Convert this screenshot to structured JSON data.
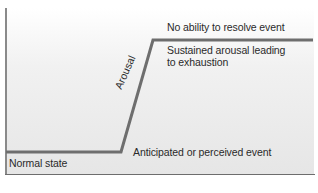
{
  "diagram": {
    "type": "process-curve",
    "labels": {
      "top_state": "No ability to resolve event",
      "sustained_line1": "Sustained arousal leading",
      "sustained_line2": "to exhaustion",
      "normal": "Normal state",
      "event": "Anticipated or perceived event",
      "arousal": "Arousal"
    },
    "colors": {
      "line": "#6e6e6e",
      "axis": "#8a8a8a",
      "text": "#2a2a2a",
      "background_top": "#ffffff",
      "background_bottom": "#e6e6e6"
    },
    "path_points": [
      [
        6,
        152
      ],
      [
        121,
        152
      ],
      [
        153,
        40
      ],
      [
        313,
        40
      ]
    ]
  }
}
